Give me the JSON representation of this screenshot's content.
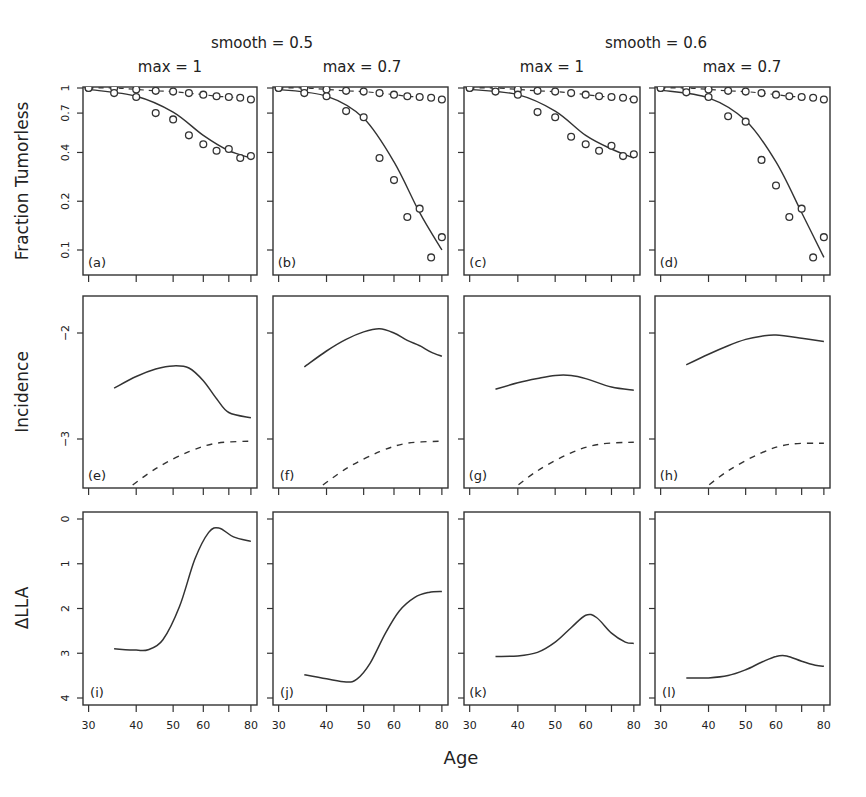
{
  "figure": {
    "group_titles": [
      "smooth = 0.5",
      "smooth = 0.6"
    ],
    "column_titles": [
      "max = 1",
      "max = 0.7",
      "max = 1",
      "max = 0.7"
    ],
    "xlabel": "Age",
    "row_ylabels": [
      "Fraction Tumorless",
      "Incidence",
      "ΔLLA"
    ],
    "panel_labels": [
      [
        "(a)",
        "(b)",
        "(c)",
        "(d)"
      ],
      [
        "(e)",
        "(f)",
        "(g)",
        "(h)"
      ],
      [
        "(i)",
        "(j)",
        "(k)",
        "(l)"
      ]
    ],
    "x_tick_labels": [
      "30",
      "40",
      "50",
      "60",
      "80"
    ],
    "row1_y_tick_labels": [
      "1",
      "0.7",
      "0.4",
      "0.2",
      "0.1"
    ],
    "row2_y_tick_labels": [
      "−2",
      "−3"
    ],
    "row3_y_tick_labels": [
      "4",
      "3",
      "2",
      "1",
      "0"
    ]
  },
  "chart_data": {
    "type": "line",
    "xlabel": "Age",
    "x_scale": "log",
    "x_ticks": [
      30,
      40,
      50,
      60,
      70,
      80
    ],
    "xlim": [
      29,
      83
    ],
    "grid": false,
    "layout": "3 rows × 4 columns",
    "columns": [
      {
        "smooth": 0.5,
        "max": 1
      },
      {
        "smooth": 0.5,
        "max": 0.7
      },
      {
        "smooth": 0.6,
        "max": 1
      },
      {
        "smooth": 0.6,
        "max": 0.7
      }
    ],
    "rows": [
      {
        "ylabel": "Fraction Tumorless",
        "y_scale": "log",
        "y_ticks": [
          1,
          0.7,
          0.4,
          0.2,
          0.1
        ],
        "ylim": [
          0.08,
          1.0
        ],
        "obs_ages": [
          30,
          35,
          40,
          45,
          50,
          55,
          60,
          65,
          70,
          75,
          80
        ],
        "panels": [
          {
            "label": "(a)",
            "control_points": [
              1.0,
              1.0,
              0.98,
              0.96,
              0.95,
              0.93,
              0.91,
              0.89,
              0.88,
              0.87,
              0.85
            ],
            "control_fit": [
              [
                30,
                1.0
              ],
              [
                80,
                0.86
              ]
            ],
            "treated_points": [
              1.0,
              0.93,
              0.88,
              0.7,
              0.64,
              0.51,
              0.45,
              0.41,
              0.42,
              0.37,
              0.38
            ],
            "treated_fit": [
              [
                30,
                0.98
              ],
              [
                40,
                0.89
              ],
              [
                50,
                0.71
              ],
              [
                60,
                0.51
              ],
              [
                70,
                0.41
              ],
              [
                80,
                0.37
              ]
            ]
          },
          {
            "label": "(b)",
            "control_points": [
              1.0,
              1.0,
              0.98,
              0.96,
              0.95,
              0.93,
              0.91,
              0.89,
              0.88,
              0.87,
              0.85
            ],
            "control_fit": [
              [
                30,
                1.0
              ],
              [
                80,
                0.86
              ]
            ],
            "treated_points": [
              1.0,
              0.93,
              0.89,
              0.72,
              0.66,
              0.37,
              0.27,
              0.16,
              0.18,
              0.09,
              0.12
            ],
            "treated_fit": [
              [
                30,
                0.98
              ],
              [
                40,
                0.89
              ],
              [
                50,
                0.65
              ],
              [
                60,
                0.35
              ],
              [
                70,
                0.17
              ],
              [
                80,
                0.1
              ]
            ]
          },
          {
            "label": "(c)",
            "control_points": [
              1.0,
              1.0,
              0.98,
              0.96,
              0.95,
              0.93,
              0.91,
              0.89,
              0.88,
              0.87,
              0.85
            ],
            "control_fit": [
              [
                30,
                1.0
              ],
              [
                80,
                0.86
              ]
            ],
            "treated_points": [
              1.0,
              0.95,
              0.91,
              0.71,
              0.66,
              0.5,
              0.45,
              0.41,
              0.44,
              0.38,
              0.39
            ],
            "treated_fit": [
              [
                30,
                0.98
              ],
              [
                40,
                0.91
              ],
              [
                50,
                0.72
              ],
              [
                60,
                0.51
              ],
              [
                70,
                0.42
              ],
              [
                80,
                0.37
              ]
            ]
          },
          {
            "label": "(d)",
            "control_points": [
              1.0,
              1.0,
              0.98,
              0.96,
              0.95,
              0.93,
              0.91,
              0.89,
              0.88,
              0.87,
              0.85
            ],
            "control_fit": [
              [
                30,
                1.0
              ],
              [
                80,
                0.86
              ]
            ],
            "treated_points": [
              1.0,
              0.94,
              0.88,
              0.67,
              0.62,
              0.36,
              0.25,
              0.16,
              0.18,
              0.09,
              0.12
            ],
            "treated_fit": [
              [
                30,
                0.97
              ],
              [
                40,
                0.87
              ],
              [
                50,
                0.63
              ],
              [
                60,
                0.35
              ],
              [
                70,
                0.17
              ],
              [
                80,
                0.09
              ]
            ]
          }
        ]
      },
      {
        "ylabel": "Incidence",
        "y_ticks": [
          -2,
          -3
        ],
        "ylim": [
          -3.5,
          -1.65
        ],
        "panels": [
          {
            "label": "(e)",
            "solid": [
              [
                35,
                -2.52
              ],
              [
                40,
                -2.41
              ],
              [
                45,
                -2.34
              ],
              [
                50,
                -2.31
              ],
              [
                55,
                -2.33
              ],
              [
                60,
                -2.45
              ],
              [
                65,
                -2.62
              ],
              [
                70,
                -2.75
              ],
              [
                80,
                -2.8
              ]
            ],
            "dashed": [
              [
                37,
                -3.5
              ],
              [
                45,
                -3.28
              ],
              [
                55,
                -3.12
              ],
              [
                65,
                -3.04
              ],
              [
                80,
                -3.02
              ]
            ]
          },
          {
            "label": "(f)",
            "solid": [
              [
                35,
                -2.32
              ],
              [
                40,
                -2.17
              ],
              [
                45,
                -2.06
              ],
              [
                50,
                -1.99
              ],
              [
                55,
                -1.96
              ],
              [
                60,
                -2.0
              ],
              [
                65,
                -2.07
              ],
              [
                70,
                -2.12
              ],
              [
                75,
                -2.18
              ],
              [
                80,
                -2.22
              ]
            ],
            "dashed": [
              [
                37,
                -3.5
              ],
              [
                45,
                -3.28
              ],
              [
                55,
                -3.12
              ],
              [
                65,
                -3.04
              ],
              [
                80,
                -3.02
              ]
            ]
          },
          {
            "label": "(g)",
            "solid": [
              [
                35,
                -2.53
              ],
              [
                40,
                -2.47
              ],
              [
                45,
                -2.43
              ],
              [
                50,
                -2.4
              ],
              [
                55,
                -2.4
              ],
              [
                60,
                -2.43
              ],
              [
                70,
                -2.51
              ],
              [
                80,
                -2.54
              ]
            ],
            "dashed": [
              [
                38,
                -3.5
              ],
              [
                45,
                -3.3
              ],
              [
                55,
                -3.13
              ],
              [
                65,
                -3.05
              ],
              [
                80,
                -3.03
              ]
            ]
          },
          {
            "label": "(h)",
            "solid": [
              [
                35,
                -2.3
              ],
              [
                40,
                -2.2
              ],
              [
                45,
                -2.12
              ],
              [
                50,
                -2.06
              ],
              [
                55,
                -2.03
              ],
              [
                60,
                -2.02
              ],
              [
                70,
                -2.05
              ],
              [
                80,
                -2.08
              ]
            ],
            "dashed": [
              [
                38,
                -3.5
              ],
              [
                45,
                -3.3
              ],
              [
                55,
                -3.13
              ],
              [
                65,
                -3.05
              ],
              [
                80,
                -3.04
              ]
            ]
          }
        ]
      },
      {
        "ylabel": "ΔLLA",
        "y_ticks": [
          0,
          1,
          2,
          3,
          4
        ],
        "ylim": [
          -0.1,
          4.1
        ],
        "panels": [
          {
            "label": "(i)",
            "solid": [
              [
                35,
                1.1
              ],
              [
                40,
                1.07
              ],
              [
                43,
                1.08
              ],
              [
                47,
                1.3
              ],
              [
                52,
                2.05
              ],
              [
                57,
                3.1
              ],
              [
                62,
                3.7
              ],
              [
                66,
                3.8
              ],
              [
                72,
                3.6
              ],
              [
                80,
                3.5
              ]
            ]
          },
          {
            "label": "(j)",
            "solid": [
              [
                35,
                0.52
              ],
              [
                40,
                0.43
              ],
              [
                45,
                0.36
              ],
              [
                48,
                0.42
              ],
              [
                52,
                0.78
              ],
              [
                57,
                1.45
              ],
              [
                62,
                1.95
              ],
              [
                68,
                2.25
              ],
              [
                74,
                2.36
              ],
              [
                80,
                2.38
              ]
            ]
          },
          {
            "label": "(k)",
            "solid": [
              [
                35,
                0.93
              ],
              [
                40,
                0.94
              ],
              [
                45,
                1.02
              ],
              [
                50,
                1.25
              ],
              [
                55,
                1.57
              ],
              [
                60,
                1.85
              ],
              [
                64,
                1.8
              ],
              [
                70,
                1.45
              ],
              [
                76,
                1.25
              ],
              [
                80,
                1.22
              ]
            ]
          },
          {
            "label": "(l)",
            "solid": [
              [
                35,
                0.45
              ],
              [
                40,
                0.45
              ],
              [
                45,
                0.5
              ],
              [
                50,
                0.63
              ],
              [
                55,
                0.8
              ],
              [
                60,
                0.93
              ],
              [
                64,
                0.94
              ],
              [
                70,
                0.82
              ],
              [
                76,
                0.73
              ],
              [
                80,
                0.71
              ]
            ]
          }
        ]
      }
    ],
    "legend": "none; open circles = observed, solid line = treated fit, dashed line = control fit"
  }
}
